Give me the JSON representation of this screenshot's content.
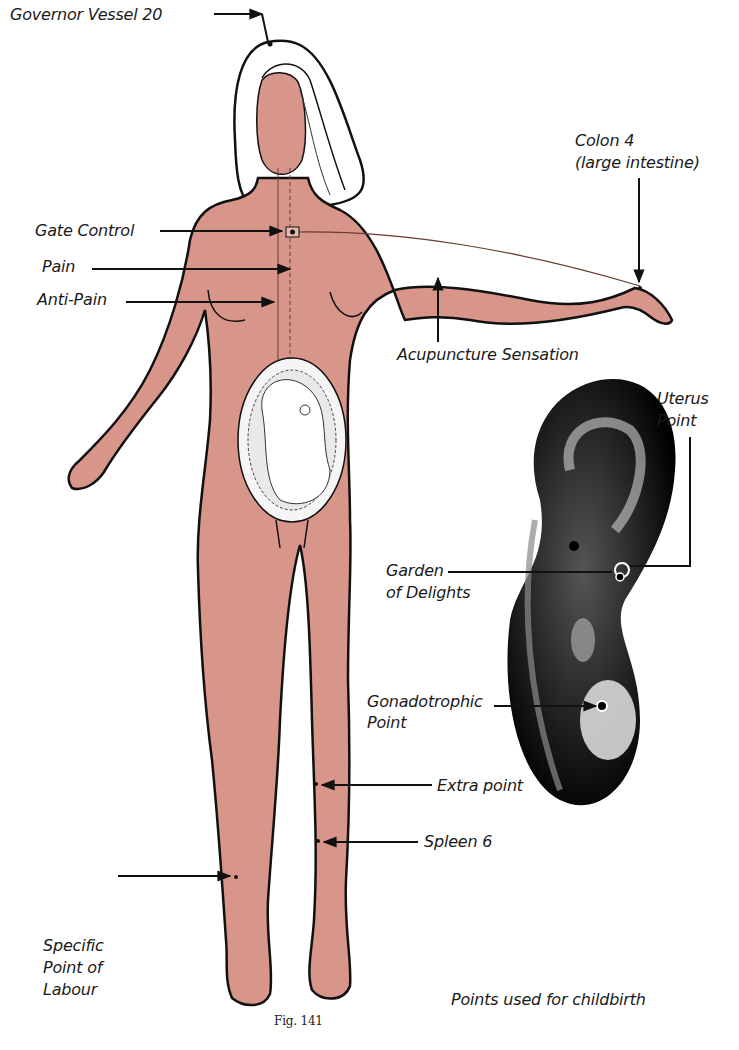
{
  "figure": {
    "number_label": "Fig. 141",
    "caption": "Points used for childbirth",
    "colors": {
      "skin": "#d8968a",
      "outline": "#111111",
      "ear": "#1a1a1a",
      "background": "#ffffff"
    }
  },
  "body_labels": {
    "governor_vessel": "Governor Vessel 20",
    "gate_control": "Gate Control",
    "pain": "Pain",
    "anti_pain": "Anti-Pain",
    "colon_line1": "Colon 4",
    "colon_line2": "(large intestine)",
    "acupuncture_sensation": "Acupuncture Sensation",
    "extra_point": "Extra point",
    "spleen": "Spleen 6",
    "specific_line1": "Specific",
    "specific_line2": "Point of",
    "specific_line3": "Labour"
  },
  "ear_labels": {
    "uterus_line1": "Uterus",
    "uterus_line2": "Point",
    "garden_line1": "Garden",
    "garden_line2": "of Delights",
    "gonado_line1": "Gonadotrophic",
    "gonado_line2": "Point"
  }
}
